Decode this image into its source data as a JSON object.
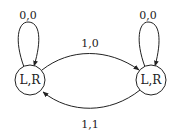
{
  "diagram": {
    "type": "state-machine",
    "nodes": [
      {
        "id": "left",
        "label": "L,R"
      },
      {
        "id": "right",
        "label": "L,R"
      }
    ],
    "edges": [
      {
        "from": "left",
        "to": "left",
        "label": "0,0"
      },
      {
        "from": "right",
        "to": "right",
        "label": "0,0"
      },
      {
        "from": "left",
        "to": "right",
        "label": "1,0"
      },
      {
        "from": "right",
        "to": "left",
        "label": "1,1"
      }
    ],
    "colors": {
      "stroke": "#222222",
      "background": "#ffffff"
    }
  }
}
